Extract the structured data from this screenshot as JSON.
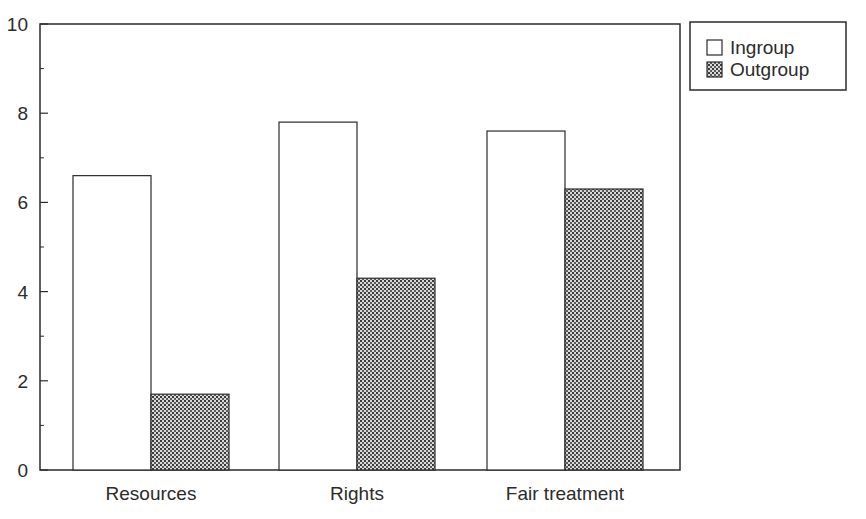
{
  "chart_data": {
    "type": "bar",
    "title": "",
    "xlabel": "",
    "ylabel": "",
    "categories": [
      "Resources",
      "Rights",
      "Fair treatment"
    ],
    "series": [
      {
        "name": "Ingroup",
        "values": [
          6.6,
          7.8,
          7.6
        ],
        "fill": "white"
      },
      {
        "name": "Outgroup",
        "values": [
          1.7,
          4.3,
          6.3
        ],
        "fill": "stippled-gray"
      }
    ],
    "ylim": [
      0,
      10
    ],
    "yticks": [
      0,
      2,
      4,
      6,
      8,
      10
    ],
    "minor_yticks": [
      1,
      3,
      5,
      7,
      9
    ],
    "grid": false,
    "legend_position": "outside-top-right"
  },
  "colors": {
    "axis": "#2b2b2b",
    "ingroup_fill": "#ffffff",
    "outgroup_dot": "#3a3a3a",
    "outgroup_bg": "#d9d9d9"
  }
}
